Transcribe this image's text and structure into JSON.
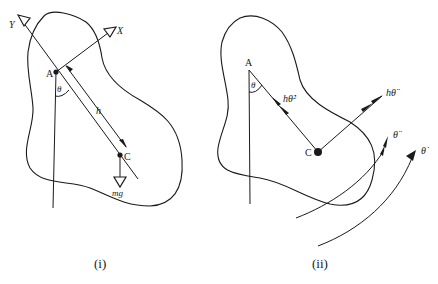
{
  "panels": [
    {
      "caption": "(i)",
      "labels": {
        "point_a": "A",
        "point_c": "C",
        "axis_x": "X",
        "axis_y": "Y",
        "angle": "θ",
        "distance": "h",
        "weight": "mg"
      }
    },
    {
      "caption": "(ii)",
      "labels": {
        "point_a": "A",
        "point_c": "C",
        "angle": "θ",
        "centripetal": "hθ̇²",
        "tangential": "hθ̈",
        "angular_accel": "θ̈",
        "angular_vel": "θ̇"
      }
    }
  ]
}
